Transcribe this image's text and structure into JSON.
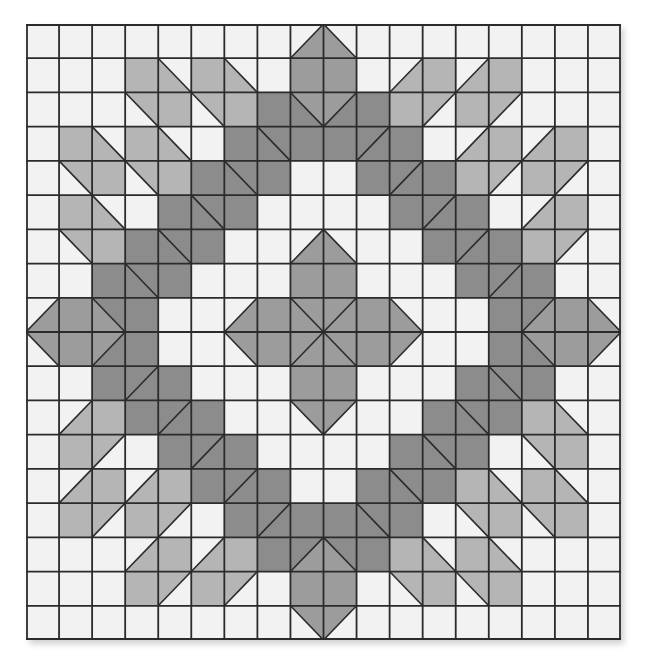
{
  "quilt": {
    "rows": 18,
    "cols": 18,
    "symmetry": "four-fold mirror (quadrant reflected horizontally and vertically)",
    "colors": {
      "W": "#f2f2f2",
      "L": "#b5b5b5",
      "M": "#9c9c9c",
      "D": "#8c8c8c",
      "line": "#2b2b2b"
    },
    "cell_legend": {
      "plain": "single letter = solid fill color key",
      "triangle_backslash": "[\"\\\\\", lowerLeft, upperRight] diagonal from top-left to bottom-right",
      "triangle_slash": "[\"/\", upperLeft, lowerRight] diagonal from bottom-left to top-right"
    },
    "quadrant_top_left": [
      [
        "W",
        "W",
        "W",
        "W",
        "W",
        "W",
        "W",
        "W",
        [
          "/",
          "W",
          "M"
        ]
      ],
      [
        "W",
        "W",
        "W",
        "L",
        [
          "\\",
          "L",
          "W"
        ],
        "L",
        [
          "\\",
          "L",
          "W"
        ],
        "W",
        "M"
      ],
      [
        "W",
        "W",
        "W",
        [
          "\\",
          "W",
          "L"
        ],
        "L",
        [
          "\\",
          "W",
          "L"
        ],
        "L",
        "D",
        [
          "\\",
          "D",
          "M"
        ]
      ],
      [
        "W",
        "L",
        [
          "\\",
          "L",
          "W"
        ],
        "L",
        [
          "\\",
          "L",
          "W"
        ],
        "W",
        "D",
        [
          "\\",
          "D",
          "D"
        ],
        "D"
      ],
      [
        "W",
        [
          "\\",
          "W",
          "L"
        ],
        "L",
        [
          "\\",
          "W",
          "L"
        ],
        "L",
        "D",
        [
          "\\",
          "D",
          "D"
        ],
        "D",
        "W"
      ],
      [
        "W",
        "L",
        [
          "\\",
          "L",
          "W"
        ],
        "W",
        "D",
        [
          "\\",
          "D",
          "D"
        ],
        "D",
        "W",
        "W"
      ],
      [
        "W",
        [
          "\\",
          "W",
          "L"
        ],
        "L",
        "D",
        [
          "\\",
          "D",
          "D"
        ],
        "D",
        "W",
        "W",
        [
          "/",
          "W",
          "M"
        ]
      ],
      [
        "W",
        "W",
        "D",
        [
          "\\",
          "D",
          "D"
        ],
        "D",
        "W",
        "W",
        "W",
        "M"
      ],
      [
        [
          "/",
          "W",
          "M"
        ],
        "M",
        [
          "\\",
          "M",
          "D"
        ],
        "D",
        "W",
        "W",
        [
          "/",
          "W",
          "M"
        ],
        "M",
        [
          "\\",
          "M",
          "M"
        ]
      ]
    ]
  }
}
